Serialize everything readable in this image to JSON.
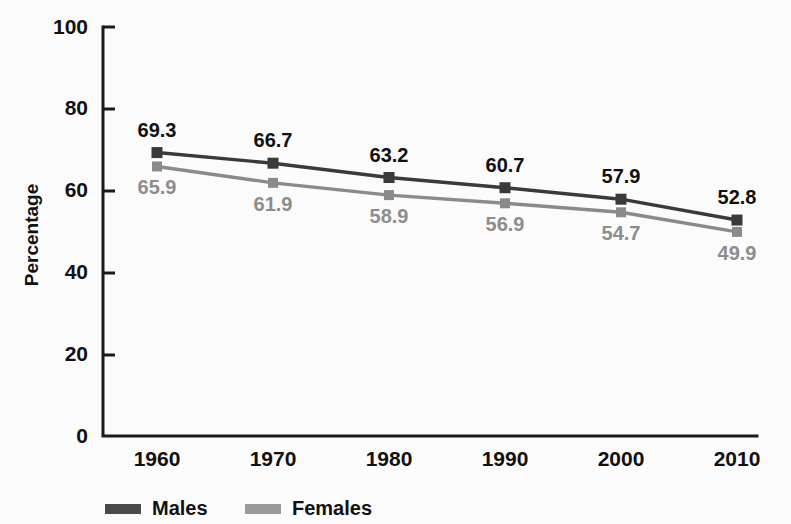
{
  "chart_data": {
    "type": "line",
    "title": "",
    "xlabel": "",
    "ylabel": "Percentage",
    "categories": [
      "1960",
      "1970",
      "1980",
      "1990",
      "2000",
      "2010"
    ],
    "ylim": [
      0,
      100
    ],
    "yticks": [
      "0",
      "20",
      "40",
      "60",
      "80",
      "100"
    ],
    "grid": false,
    "legend_position": "bottom-center",
    "series": [
      {
        "name": "Males",
        "color": "#3a3a3a",
        "values": [
          69.3,
          66.7,
          63.2,
          60.7,
          57.9,
          52.8
        ],
        "labels": [
          "69.3",
          "66.7",
          "63.2",
          "60.7",
          "57.9",
          "52.8"
        ]
      },
      {
        "name": "Females",
        "color": "#8a8a8a",
        "values": [
          65.9,
          61.9,
          58.9,
          56.9,
          54.7,
          49.9
        ],
        "labels": [
          "65.9",
          "61.9",
          "58.9",
          "56.9",
          "54.7",
          "49.9"
        ]
      }
    ]
  },
  "legend": {
    "items": [
      {
        "label": "Males",
        "swatch": "males-swatch-icon"
      },
      {
        "label": "Females",
        "swatch": "females-swatch-icon"
      }
    ]
  }
}
